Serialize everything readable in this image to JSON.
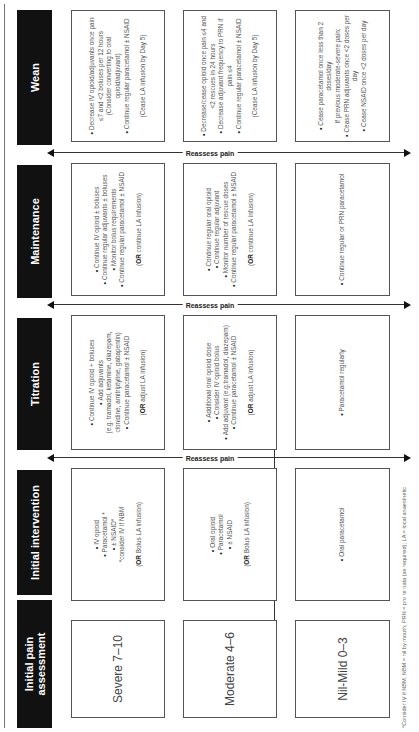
{
  "columns": [
    {
      "id": "assessment",
      "header": "Initial pain assessment"
    },
    {
      "id": "intervention",
      "header": "Initial intervention"
    },
    {
      "id": "titration",
      "header": "Titration"
    },
    {
      "id": "maintenance",
      "header": "Maintenance"
    },
    {
      "id": "wean",
      "header": "Wean"
    }
  ],
  "reassess_label": "Reassess pain",
  "rows": {
    "severe": {
      "assessment": "Severe 7–10",
      "intervention": {
        "items": [
          "IV opioid",
          "Paracetamol *",
          "± NSAID*"
        ],
        "note": "*consider IV if NBM",
        "or_prefix": "OR",
        "or_text": " Bolus LA infusion"
      },
      "titration": {
        "items": [
          "Continue IV opioid + boluses",
          "Add adjuvants"
        ],
        "examples": "(e.g. tramadol, ketamine, diazepam, clonidine, amitriptyline, gabapentin)",
        "items2": [
          "Continue paracetamol ± NSAID"
        ],
        "or_prefix": "OR",
        "or_text": " adjust LA infusion"
      },
      "maintenance": {
        "items": [
          "Continue IV opioid ± boluses",
          "Continue regular adjuvants ± boluses",
          "Monitor bolus requirements",
          "Continue regular paracetamol ± NSAID"
        ],
        "or_prefix": "OR",
        "or_text": " continue LA infusion"
      },
      "wean": {
        "items": [
          "Decrease IV opioid/adjuvants once pain ≤7 and <2 boluses per 12 hours"
        ],
        "examples": "(Consider converting to oral opioid/adjuvant)",
        "items2": [
          "Continue regular paracetamol ± NSAID"
        ],
        "note": "(Cease LA infusion by Day 5)"
      }
    },
    "moderate": {
      "assessment": "Moderate 4–6",
      "intervention": {
        "items": [
          "Oral opioid",
          "Paracetamol",
          "± NSAID"
        ],
        "or_prefix": "OR",
        "or_text": " Bolus LA infusion"
      },
      "titration": {
        "items": [
          "Additional oral opioid dose",
          "Consider IV opioid bolus",
          "Add adjuvant (e.g.tramadol, diazepam)",
          "Continue paracetamol ± NSAID"
        ],
        "or_prefix": "OR",
        "or_text": " adjust LA infusion"
      },
      "maintenance": {
        "items": [
          "Continue regular oral opioid",
          "Continue regular adjuvant",
          "Monitor number of rescue doses",
          "Continue regular paracetamol ± NSAID"
        ],
        "or_prefix": "OR",
        "or_text": " continue LA infusion"
      },
      "wean": {
        "items": [
          "Decrease/cease opioid once pain ≤4 and <2 rescues in 24 hours",
          "Decrease adjuvant frequency to PRN if pain ≤4",
          "Continue regular paracetamol ± NSAID"
        ],
        "note": "(Cease LA infusion by Day 5)"
      }
    },
    "mild": {
      "assessment": "Nil-Mild 0–3",
      "intervention": {
        "items": [
          "Oral paracetamol"
        ]
      },
      "titration": {
        "items": [
          "Paracetamol regularly"
        ]
      },
      "maintenance": {
        "items": [
          "Continue regular or PRN paracetamol"
        ]
      },
      "wean": {
        "items": [
          "Cease paracetamol once less than 2 doses/day"
        ],
        "note": "If previous moderate-severe pain:",
        "items2": [
          "Cease PRN adjuvants once <2 doses per day",
          "Cease NSAID once <2 doses per day"
        ]
      }
    }
  },
  "footer": "*Consider IV if NBM. NBM = nil by mouth; PRN = pro re nata (as required); LA = local anaesthetic"
}
